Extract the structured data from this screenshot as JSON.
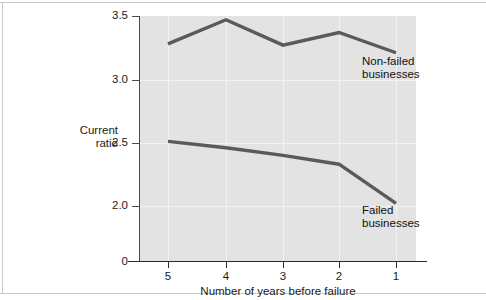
{
  "chart_data": {
    "type": "line",
    "title": "",
    "xlabel": "Number of years before failure",
    "ylabel": "Current ratio",
    "ylabel_line1": "Current",
    "ylabel_line2": "ratio",
    "categories": [
      "5",
      "4",
      "3",
      "2",
      "1"
    ],
    "x": [
      5,
      4,
      3,
      2,
      1
    ],
    "xtick_labels": [
      "5",
      "4",
      "3",
      "2",
      "1"
    ],
    "ytick_labels": [
      "3.5",
      "3.0",
      "2.5",
      "2.0",
      "0"
    ],
    "ytick_values": [
      3.5,
      3.0,
      2.5,
      2.0,
      0
    ],
    "ylim": [
      0,
      3.5
    ],
    "y_axis_broken": true,
    "grid": true,
    "legend_position": "inline-annotations",
    "series": [
      {
        "name": "Non-failed businesses",
        "label_line1": "Non-failed",
        "label_line2": "businesses",
        "color": "#5a5a5a",
        "values": [
          3.28,
          3.47,
          3.27,
          3.37,
          3.21
        ]
      },
      {
        "name": "Failed businesses",
        "label_line1": "Failed",
        "label_line2": "businesses",
        "color": "#5a5a5a",
        "values": [
          2.51,
          2.46,
          2.4,
          2.33,
          2.02
        ]
      }
    ],
    "plot_background": "#e3e3e3",
    "grid_color": "#f2f2f2",
    "axis_color": "#2b2b2b",
    "line_color": "#5a5a5a",
    "page_background": "#ffffff"
  }
}
